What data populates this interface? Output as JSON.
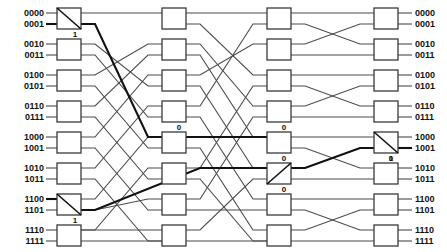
{
  "diagram": {
    "type": "butterfly-network",
    "stage_count": 4,
    "line_count": 16,
    "left_labels": [
      "0000",
      "0001",
      "0010",
      "0011",
      "0100",
      "0101",
      "0110",
      "0111",
      "1000",
      "1001",
      "1010",
      "1011",
      "1100",
      "1101",
      "1110",
      "1111"
    ],
    "right_labels": [
      "0000",
      "0001",
      "0010",
      "0011",
      "0100",
      "0101",
      "0110",
      "0111",
      "1000",
      "1001",
      "1010",
      "1011",
      "1100",
      "1101",
      "1110",
      "1111"
    ],
    "switch_labels": [
      {
        "id": "sw-s1-r0",
        "text": "1",
        "x": 72,
        "y": 35,
        "anchor": "middle"
      },
      {
        "id": "sw-s1-r6",
        "text": "1",
        "x": 72,
        "y": 221,
        "anchor": "middle"
      },
      {
        "id": "sw-s2-r0",
        "text": "0",
        "x": 174,
        "y": 130,
        "anchor": "middle"
      },
      {
        "id": "sw-s3-r0",
        "text": "0",
        "x": 279,
        "y": 130,
        "anchor": "middle"
      },
      {
        "id": "sw-s3-r5",
        "text": "0",
        "x": 279,
        "y": 161,
        "anchor": "middle"
      },
      {
        "id": "sw-s3-r7",
        "text": "0",
        "x": 279,
        "y": 192,
        "anchor": "middle"
      },
      {
        "id": "sw-s4-r4",
        "text": "0",
        "x": 386,
        "y": 161,
        "anchor": "middle"
      },
      {
        "id": "sw-s4-r4b",
        "text": "1",
        "x": 386,
        "y": 159,
        "anchor": "middle"
      }
    ],
    "geometry": {
      "row_y": [
        13,
        24,
        44,
        55,
        75,
        86,
        106,
        117,
        137,
        148,
        168,
        179,
        199,
        210,
        230,
        241
      ],
      "stage_x": [
        57,
        162,
        267,
        374
      ],
      "box_w": 24,
      "box_h": 21,
      "label_left_x": 40,
      "label_right_x": 408
    },
    "annotations": {
      "bold_path_description": "Highlighted route traced from input 0001 through the network to output 1001",
      "bold_switch_settings": [
        "1",
        "1",
        "0",
        "0",
        "0",
        "1"
      ]
    }
  }
}
